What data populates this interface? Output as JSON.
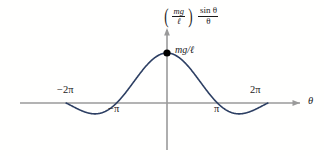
{
  "figure": {
    "kind": "math-plot",
    "background_color": "#fffffe"
  },
  "axes": {
    "x_axis_label": "θ",
    "y_axis_label_parts": {
      "open_paren": "(",
      "coefficient_numerator": "mg",
      "coefficient_denominator": "ℓ",
      "close_paren": ")",
      "function_numerator": "sin θ",
      "function_denominator": "θ"
    },
    "y_axis_label_text": "(mg/ℓ) sin θ / θ",
    "axis_color": "#9a9a9a",
    "x_ticks": [
      {
        "label": "−2π",
        "value": -6.2832,
        "position": "above"
      },
      {
        "label": "−π",
        "value": -3.1416,
        "position": "below"
      },
      {
        "label": "π",
        "value": 3.1416,
        "position": "below"
      },
      {
        "label": "2π",
        "value": 6.2832,
        "position": "above"
      }
    ]
  },
  "annotations": {
    "peak_label": "mg/ℓ",
    "peak_marker_color": "#000000"
  },
  "chart_data": {
    "type": "line",
    "title": "",
    "subtitle": "",
    "xlabel": "θ",
    "ylabel": "(mg/ℓ) sin θ / θ",
    "xlim": [
      -7.5,
      8.6
    ],
    "ylim": [
      -0.42,
      1.28
    ],
    "grid": false,
    "legend": null,
    "line_color": "#2d3f63",
    "line_width": 1.6,
    "function": "(mg/l) * sin(theta)/theta",
    "domain": [
      -6.2832,
      6.2832
    ],
    "zeros": [
      -6.2832,
      -3.1416,
      3.1416,
      6.2832
    ],
    "maximum": {
      "x": 0,
      "y": 1.0,
      "label": "mg/ℓ"
    },
    "minima": [
      {
        "x": -4.4934,
        "y": -0.2172
      },
      {
        "x": 4.4934,
        "y": -0.2172
      }
    ],
    "markers": [
      {
        "x": 0,
        "y": 1.0,
        "style": "filled-circle",
        "color": "#000000",
        "label": "mg/ℓ"
      }
    ],
    "x": [
      -6.2832,
      -5.9,
      -5.5,
      -5.1,
      -4.7,
      -4.4934,
      -4.1,
      -3.7,
      -3.4,
      -3.1416,
      -2.8,
      -2.4,
      -2.0,
      -1.6,
      -1.2,
      -0.8,
      -0.4,
      0,
      0.4,
      0.8,
      1.2,
      1.6,
      2.0,
      2.4,
      2.8,
      3.1416,
      3.4,
      3.7,
      4.1,
      4.4934,
      4.7,
      5.1,
      5.5,
      5.9,
      6.2832
    ],
    "y": [
      0,
      -0.0636,
      -0.1281,
      -0.1767,
      -0.2103,
      -0.2172,
      -0.2046,
      -0.1452,
      -0.0754,
      0,
      0.1204,
      0.2812,
      0.4546,
      0.6247,
      0.7767,
      0.8967,
      0.9735,
      1.0,
      0.9735,
      0.8967,
      0.7767,
      0.6247,
      0.4546,
      0.2812,
      0.1204,
      0,
      -0.0754,
      -0.1452,
      -0.2046,
      -0.2172,
      -0.2103,
      -0.1767,
      -0.1281,
      -0.0636,
      0
    ]
  }
}
